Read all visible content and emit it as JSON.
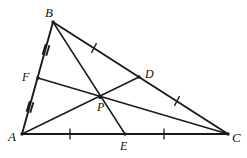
{
  "figure": {
    "canvas": {
      "width": 247,
      "height": 158
    },
    "stroke_color": "#1a1a1a",
    "label_color": "#111111",
    "background_color": "#ffffff"
  },
  "points": [
    {
      "id": "A",
      "label": "A",
      "x": 22,
      "y": 134,
      "label_x": 8,
      "label_y": 130,
      "role": "vertex"
    },
    {
      "id": "B",
      "label": "B",
      "x": 53,
      "y": 22,
      "label_x": 45,
      "label_y": 6,
      "role": "vertex"
    },
    {
      "id": "C",
      "label": "C",
      "x": 228,
      "y": 134,
      "label_x": 232,
      "label_y": 131,
      "role": "vertex"
    },
    {
      "id": "D",
      "label": "D",
      "x": 139,
      "y": 77,
      "label_x": 145,
      "label_y": 68,
      "role": "midpoint-of-BC"
    },
    {
      "id": "E",
      "label": "E",
      "x": 125,
      "y": 134,
      "label_x": 120,
      "label_y": 140,
      "role": "midpoint-of-AC"
    },
    {
      "id": "F",
      "label": "F",
      "x": 38,
      "y": 78,
      "label_x": 22,
      "label_y": 71,
      "role": "midpoint-of-AB"
    },
    {
      "id": "P",
      "label": "P",
      "x": 100,
      "y": 97,
      "label_x": 97,
      "label_y": 101,
      "role": "centroid"
    }
  ],
  "segments": [
    {
      "id": "AB",
      "from": "A",
      "to": "B",
      "kind": "triangle-side"
    },
    {
      "id": "BC",
      "from": "B",
      "to": "C",
      "kind": "triangle-side"
    },
    {
      "id": "AC",
      "from": "A",
      "to": "C",
      "kind": "triangle-side"
    },
    {
      "id": "AD",
      "from": "A",
      "to": "D",
      "kind": "median"
    },
    {
      "id": "BE",
      "from": "B",
      "to": "E",
      "kind": "median"
    },
    {
      "id": "CF",
      "from": "F",
      "to": "C",
      "kind": "median"
    }
  ],
  "tick_marks": [
    {
      "id": "tick-AE",
      "on": "AC",
      "x": 70,
      "y": 134,
      "count": 1,
      "angle": 90,
      "length": 11
    },
    {
      "id": "tick-EC",
      "on": "AC",
      "x": 164,
      "y": 134,
      "count": 1,
      "angle": 90,
      "length": 11
    },
    {
      "id": "tick-BD",
      "on": "BC",
      "x": 94,
      "y": 48,
      "count": 1,
      "angle": 118,
      "length": 11
    },
    {
      "id": "tick-DC",
      "on": "BC",
      "x": 177,
      "y": 101,
      "count": 1,
      "angle": 118,
      "length": 11
    },
    {
      "id": "tick-BF",
      "on": "AB",
      "x": 46,
      "y": 50,
      "count": 2,
      "angle": 107,
      "length": 11
    },
    {
      "id": "tick-FA",
      "on": "AB",
      "x": 30,
      "y": 107,
      "count": 2,
      "angle": 107,
      "length": 11
    }
  ]
}
